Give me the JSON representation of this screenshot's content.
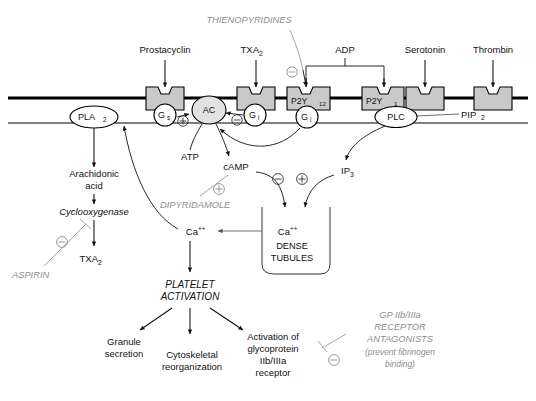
{
  "diagram": {
    "membrane": {
      "label_outer": "plasma membrane",
      "label_inner": "cytoplasmic face"
    },
    "agonists": [
      {
        "id": "prostacyclin",
        "label": "Prostacyclin"
      },
      {
        "id": "txa2",
        "label": "TXA",
        "sub": "2"
      },
      {
        "id": "adp",
        "label": "ADP"
      },
      {
        "id": "serotonin",
        "label": "Serotonin"
      },
      {
        "id": "thrombin",
        "label": "Thrombin"
      }
    ],
    "receptors": [
      {
        "id": "ip-receptor",
        "label": "",
        "sub": ""
      },
      {
        "id": "tp-receptor",
        "label": "",
        "sub": ""
      },
      {
        "id": "p2y12",
        "label": "P2Y",
        "sub": "12"
      },
      {
        "id": "p2y1",
        "label": "P2Y",
        "sub": "1"
      },
      {
        "id": "serotonin-receptor",
        "label": "",
        "sub": ""
      },
      {
        "id": "thrombin-receptor",
        "label": "",
        "sub": ""
      }
    ],
    "g_proteins": [
      {
        "id": "gs",
        "label": "G",
        "sub": "s"
      },
      {
        "id": "gi-txa2",
        "label": "G",
        "sub": "i"
      },
      {
        "id": "gi-p2y12",
        "label": "G",
        "sub": "i"
      }
    ],
    "enzymes": [
      {
        "id": "pla2",
        "label": "PLA",
        "sub": "2"
      },
      {
        "id": "ac",
        "label": "AC",
        "sub": ""
      },
      {
        "id": "plc",
        "label": "PLC",
        "sub": ""
      }
    ],
    "metabolites": [
      {
        "id": "pip2",
        "label": "PIP",
        "sub": "2"
      },
      {
        "id": "atp",
        "label": "ATP",
        "sub": ""
      },
      {
        "id": "camp",
        "label": "cAMP",
        "sub": ""
      },
      {
        "id": "ip3",
        "label": "IP",
        "sub": "3"
      },
      {
        "id": "arachidonic-acid-line1",
        "label": "Arachidonic",
        "sub": ""
      },
      {
        "id": "arachidonic-acid-line2",
        "label": "acid",
        "sub": ""
      },
      {
        "id": "cyclooxygenase",
        "label": "Cyclooxygenase",
        "sub": ""
      },
      {
        "id": "txa2-product",
        "label": "TXA",
        "sub": "2"
      },
      {
        "id": "calcium-cytosol",
        "label": "Ca",
        "sup": "++"
      },
      {
        "id": "calcium-store",
        "label": "Ca",
        "sup": "++"
      }
    ],
    "organelle": {
      "id": "dense-tubules",
      "line1": "DENSE",
      "line2": "TUBULES"
    },
    "activation": {
      "line1": "PLATELET",
      "line2": "ACTIVATION"
    },
    "outcomes": [
      {
        "id": "granule-secretion",
        "lines": [
          "Granule",
          "secretion"
        ]
      },
      {
        "id": "cytoskeletal-reorganization",
        "lines": [
          "Cytoskeletal",
          "reorganization"
        ]
      },
      {
        "id": "gpiibiiia-activation",
        "lines": [
          "Activation of",
          "glycoprotein",
          "IIb/IIIa",
          "receptor"
        ]
      }
    ],
    "drugs": [
      {
        "id": "thienopyridines",
        "lines": [
          "THIENOPYRIDINES"
        ],
        "effect": "inhibit",
        "target": "p2y12"
      },
      {
        "id": "dipyridamole",
        "lines": [
          "DIPYRIDAMOLE"
        ],
        "effect": "potentiate",
        "target": "camp"
      },
      {
        "id": "aspirin",
        "lines": [
          "ASPIRIN"
        ],
        "effect": "inhibit",
        "target": "cyclooxygenase"
      },
      {
        "id": "gp-iib-iiia-antagonists",
        "lines": [
          "GP IIb/IIIa",
          "RECEPTOR",
          "ANTAGONISTS",
          "(prevent fibrinogen",
          "binding)"
        ],
        "effect": "inhibit",
        "target": "gpiibiiia-activation"
      }
    ],
    "signs": [
      {
        "id": "plus-gs-ac",
        "glyph": "+"
      },
      {
        "id": "minus-gi-ac",
        "glyph": "−"
      },
      {
        "id": "minus-thienopyridines",
        "glyph": "−"
      },
      {
        "id": "plus-dipyridamole",
        "glyph": "+"
      },
      {
        "id": "minus-aspirin",
        "glyph": "−"
      },
      {
        "id": "minus-camp-calcium",
        "glyph": "−"
      },
      {
        "id": "plus-ip3-calcium",
        "glyph": "+"
      },
      {
        "id": "minus-gp-antagonists",
        "glyph": "−"
      }
    ],
    "colors": {
      "receptor_fill": "#c9c9c9",
      "ac_fill": "#e2e2e2",
      "membrane": "#000000",
      "drug_text": "#8d8d8d",
      "body_text": "#111111",
      "background": "#ffffff"
    }
  }
}
